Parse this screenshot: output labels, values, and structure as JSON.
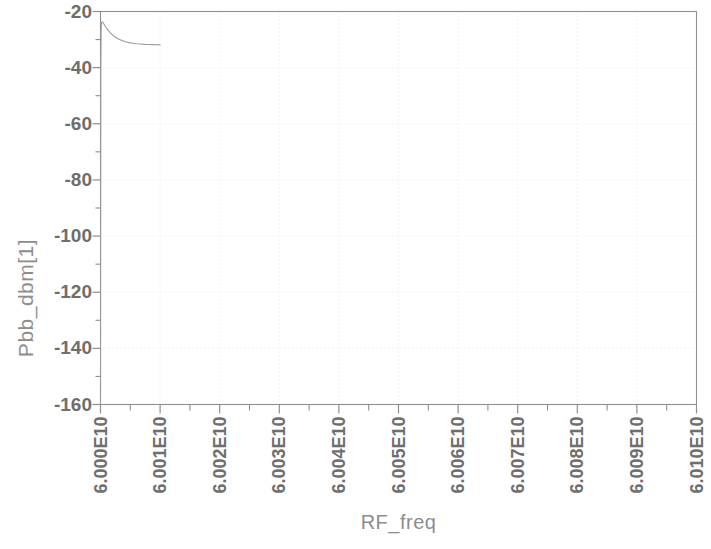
{
  "chart_data": {
    "type": "line",
    "title": "",
    "xlabel": "RF_freq",
    "ylabel": "Pbb_dbm[1]",
    "xlim": [
      60000000000,
      60100000000
    ],
    "ylim": [
      -160,
      -20
    ],
    "grid": true,
    "legend": false,
    "legend_position": "none",
    "x_tick_labels": [
      "6.000E10",
      "6.001E10",
      "6.002E10",
      "6.003E10",
      "6.004E10",
      "6.005E10",
      "6.006E10",
      "6.007E10",
      "6.008E10",
      "6.009E10",
      "6.010E10"
    ],
    "x_tick_values": [
      60000000000,
      60010000000,
      60020000000,
      60030000000,
      60040000000,
      60050000000,
      60060000000,
      60070000000,
      60080000000,
      60090000000,
      60100000000
    ],
    "y_tick_labels": [
      "-20",
      "-40",
      "-60",
      "-80",
      "-100",
      "-120",
      "-140",
      "-160"
    ],
    "y_tick_values": [
      -20,
      -40,
      -60,
      -80,
      -100,
      -120,
      -140,
      -160
    ],
    "y_minor_tick_values": [
      -30,
      -50,
      -70,
      -90,
      -110,
      -130,
      -150
    ],
    "series": [
      {
        "name": "Pbb_dbm[1]",
        "color": "#9b9b9b",
        "x": [
          60000000000,
          60000050000,
          60000100000,
          60000150000,
          60000200000,
          60000300000,
          60000400000,
          60000500000,
          60000700000,
          60000900000,
          60001100000,
          60001400000,
          60001700000,
          60002000000,
          60002400000,
          60002800000,
          60003200000,
          60003700000,
          60004200000,
          60004800000,
          60005400000,
          60006000000,
          60006700000,
          60007400000,
          60008100000,
          60008800000,
          60009400000,
          60010000000
        ],
        "y": [
          -160.0,
          -42.0,
          -27.5,
          -24.6,
          -23.9,
          -23.7,
          -23.9,
          -24.2,
          -24.9,
          -25.6,
          -26.2,
          -27.0,
          -27.7,
          -28.3,
          -29.0,
          -29.5,
          -30.0,
          -30.4,
          -30.8,
          -31.1,
          -31.3,
          -31.5,
          -31.6,
          -31.7,
          -31.75,
          -31.8,
          -31.85,
          -31.9
        ]
      }
    ],
    "colors": {
      "curve": "#9b9b9b",
      "axis": "#8f8f8f",
      "grid": "#e6e6e6",
      "tick_text": "#6e6e6e",
      "title_text": "#8d8d8d",
      "background": "#ffffff"
    }
  }
}
